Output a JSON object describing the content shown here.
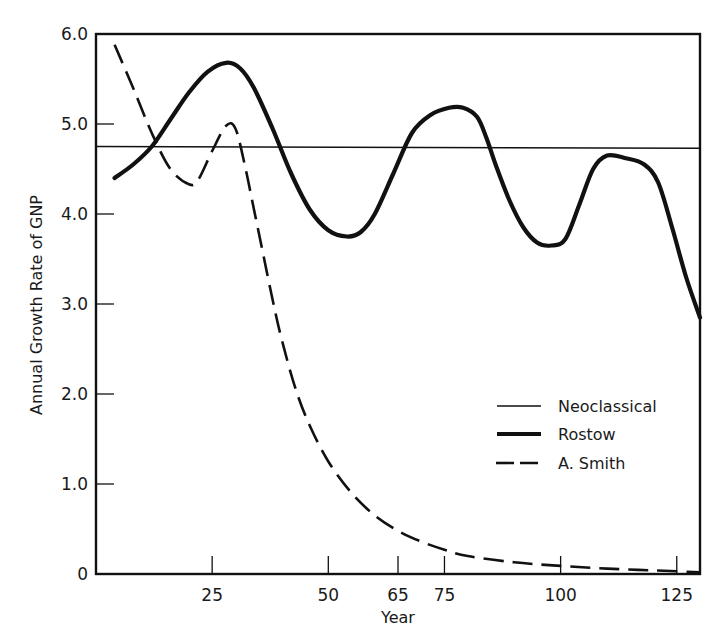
{
  "chart_data": {
    "type": "line",
    "title": "",
    "xlabel": "Year",
    "ylabel": "Annual Growth Rate of GNP",
    "xlim": [
      0,
      130
    ],
    "ylim": [
      0,
      6.0
    ],
    "x_ticks": [
      25,
      50,
      65,
      75,
      100,
      125
    ],
    "x_tick_labels": [
      "25",
      "50",
      "65",
      "75",
      "100",
      "125"
    ],
    "y_ticks": [
      0,
      1.0,
      2.0,
      3.0,
      4.0,
      5.0,
      6.0
    ],
    "y_tick_labels": [
      "0",
      "1.0",
      "2.0",
      "3.0",
      "4.0",
      "5.0",
      "6.0"
    ],
    "grid": false,
    "legend_position": "center-right",
    "series": [
      {
        "name": "Neoclassical",
        "style": "thin-solid",
        "x": [
          0,
          130
        ],
        "y": [
          4.75,
          4.73
        ]
      },
      {
        "name": "Rostow",
        "style": "thick-solid",
        "x": [
          4,
          8,
          12,
          16,
          20,
          24,
          28,
          31,
          34,
          38,
          42,
          46,
          50,
          54,
          57,
          60,
          64,
          68,
          72,
          76,
          79,
          82,
          84,
          86,
          89,
          92,
          95,
          98,
          101,
          104,
          107,
          110,
          114,
          118,
          121,
          124,
          127,
          130
        ],
        "y": [
          4.4,
          4.55,
          4.75,
          5.05,
          5.35,
          5.58,
          5.68,
          5.62,
          5.4,
          4.95,
          4.45,
          4.05,
          3.82,
          3.75,
          3.8,
          4.0,
          4.45,
          4.9,
          5.1,
          5.18,
          5.18,
          5.08,
          4.85,
          4.55,
          4.15,
          3.85,
          3.68,
          3.65,
          3.72,
          4.1,
          4.5,
          4.65,
          4.62,
          4.55,
          4.35,
          3.85,
          3.3,
          2.85
        ]
      },
      {
        "name": "A. Smith",
        "style": "dashed",
        "x": [
          4,
          8,
          12,
          16,
          20,
          22,
          25,
          28,
          30,
          32,
          34,
          36,
          38,
          40,
          43,
          46,
          50,
          55,
          60,
          65,
          70,
          75,
          80,
          90,
          100,
          110,
          120,
          130
        ],
        "y": [
          5.88,
          5.4,
          4.9,
          4.5,
          4.33,
          4.38,
          4.7,
          4.98,
          4.95,
          4.55,
          4.05,
          3.55,
          3.05,
          2.6,
          2.05,
          1.65,
          1.25,
          0.9,
          0.65,
          0.48,
          0.36,
          0.27,
          0.2,
          0.13,
          0.09,
          0.06,
          0.04,
          0.02
        ]
      }
    ]
  },
  "legend": {
    "items": [
      {
        "label": "Neoclassical",
        "style": "thin-solid"
      },
      {
        "label": "Rostow",
        "style": "thick-solid"
      },
      {
        "label": "A. Smith",
        "style": "dashed"
      }
    ]
  },
  "colors": {
    "line": "#111111",
    "background": "#ffffff"
  }
}
